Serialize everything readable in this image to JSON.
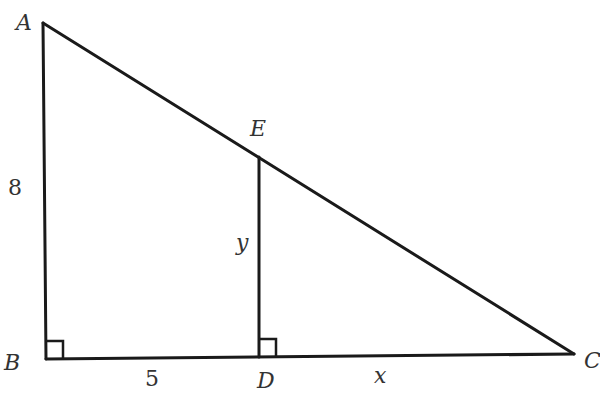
{
  "diagram": {
    "type": "geometry",
    "points": {
      "A": {
        "label": "A",
        "x": 43,
        "y": 23
      },
      "B": {
        "label": "B",
        "x": 46,
        "y": 359
      },
      "C": {
        "label": "C",
        "x": 574,
        "y": 354
      },
      "D": {
        "label": "D",
        "x": 259,
        "y": 357
      },
      "E": {
        "label": "E",
        "x": 259,
        "y": 157
      }
    },
    "segments": [
      {
        "from": "A",
        "to": "B",
        "label": "8"
      },
      {
        "from": "B",
        "to": "D",
        "label": "5"
      },
      {
        "from": "D",
        "to": "C",
        "label": "x"
      },
      {
        "from": "E",
        "to": "D",
        "label": "y"
      },
      {
        "from": "A",
        "to": "C",
        "label": ""
      }
    ],
    "right_angles": [
      "B",
      "D"
    ],
    "labels": {
      "A": "A",
      "B": "B",
      "C": "C",
      "D": "D",
      "E": "E",
      "AB": "8",
      "BD": "5",
      "DC": "x",
      "ED": "y"
    },
    "colors": {
      "line": "#1a1a1a",
      "text": "#333333",
      "background": "#ffffff"
    }
  }
}
